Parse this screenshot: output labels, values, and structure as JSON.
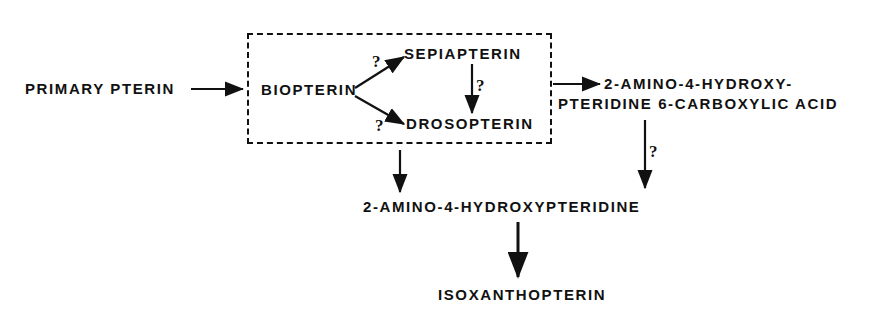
{
  "figure": {
    "type": "flow-diagram",
    "background_color": "#ffffff",
    "line_color": "#111111"
  },
  "nodes": {
    "primary_pterin": "PRIMARY  PTERIN",
    "biopterin": "BIOPTERIN",
    "sepiapterin": "SEPIAPTERIN",
    "drosopterin": "DROSOPTERIN",
    "carboxylic_acid_line1": "2-AMINO-4-HYDROXY-",
    "carboxylic_acid_line2": "PTERIDINE 6-CARBOXYLIC ACID",
    "hydroxypteridine": "2-AMINO-4-HYDROXYPTERIDINE",
    "isoxanthopterin": "ISOXANTHOPTERIN"
  },
  "annotations": {
    "q_biopterin_to_sepiapterin": "?",
    "q_biopterin_to_drosopterin": "?",
    "q_sepiapterin_to_drosopterin": "?",
    "q_acid_to_hydroxypteridine": "?"
  },
  "edges": [
    {
      "name": "primary-pterin-to-biopterin",
      "label": ""
    },
    {
      "name": "biopterin-to-sepiapterin",
      "label": "?"
    },
    {
      "name": "biopterin-to-drosopterin",
      "label": "?"
    },
    {
      "name": "sepiapterin-to-drosopterin",
      "label": "?"
    },
    {
      "name": "box-to-carboxylic-acid",
      "label": ""
    },
    {
      "name": "box-to-hydroxypteridine",
      "label": ""
    },
    {
      "name": "carboxylic-acid-to-hydroxypteridine",
      "label": "?"
    },
    {
      "name": "hydroxypteridine-to-isoxanthopterin",
      "label": ""
    }
  ]
}
